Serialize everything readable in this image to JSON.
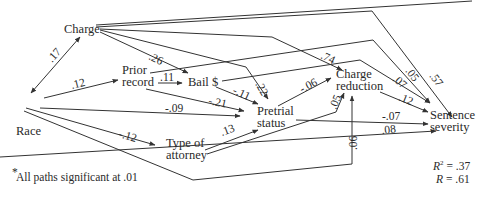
{
  "diagram": {
    "type": "path-analysis",
    "nodes": {
      "charge": {
        "label": "Charge"
      },
      "race": {
        "label": "Race"
      },
      "prior_record": {
        "line1": "Prior",
        "line2": "record"
      },
      "bail": {
        "label": "Bail $"
      },
      "pretrial_status": {
        "line1": "Pretrial",
        "line2": "status"
      },
      "type_of_attorney": {
        "line1": "Type of",
        "line2": "attorney"
      },
      "charge_reduction": {
        "line1": "Charge",
        "line2": "reduction"
      },
      "sentence_severity": {
        "line1": "Sentence",
        "line2": "severity"
      }
    },
    "edges": [
      {
        "from": "Race",
        "to": "Charge",
        "coef": ".17",
        "bidirectional": true
      },
      {
        "from": "Race",
        "to": "Prior record",
        "coef": ".12"
      },
      {
        "from": "Race",
        "to": "Pretrial status",
        "coef": "-.09"
      },
      {
        "from": "Race",
        "to": "Type of attorney",
        "coef": "-.12"
      },
      {
        "from": "Race",
        "to": "Charge reduction",
        "coef": ".06"
      },
      {
        "from": "Charge",
        "to": "Bail $",
        "coef": ".26"
      },
      {
        "from": "Charge",
        "to": "Pretrial status",
        "coef": ".22"
      },
      {
        "from": "Charge",
        "to": "Charge reduction",
        "coef": ".74"
      },
      {
        "from": "Charge",
        "to": "Sentence severity",
        "coef": ".05"
      },
      {
        "from": "Charge",
        "to": "Sentence severity",
        "coef": ".57"
      },
      {
        "from": "Prior record",
        "to": "Bail $",
        "coef": ".11"
      },
      {
        "from": "Prior record",
        "to": "Pretrial status",
        "coef": "-.21"
      },
      {
        "from": "Prior record",
        "to": "Sentence severity",
        "coef": ".07"
      },
      {
        "from": "Bail $",
        "to": "Pretrial status",
        "coef": "-.11"
      },
      {
        "from": "Bail $",
        "to": "Sentence severity",
        "coef": ""
      },
      {
        "from": "Pretrial status",
        "to": "Charge reduction",
        "coef": "-.06"
      },
      {
        "from": "Pretrial status",
        "to": "Sentence severity",
        "coef": "-.07"
      },
      {
        "from": "Type of attorney",
        "to": "Pretrial status",
        "coef": ".13"
      },
      {
        "from": "Type of attorney",
        "to": "Charge reduction",
        "coef": ".05"
      },
      {
        "from": "Type of attorney",
        "to": "Sentence severity",
        "coef": ".08"
      },
      {
        "from": "Charge reduction",
        "to": "Sentence severity",
        "coef": ".12"
      }
    ],
    "labels": {
      "race_charge": ".17",
      "race_prior": ".12",
      "race_pretrial": "-.09",
      "race_attorney": "-.12",
      "race_reduction": ".06",
      "charge_bail": ".26",
      "charge_pretrial": ".22",
      "charge_reduction": ".74",
      "charge_sentence_a": ".05",
      "charge_sentence_b": ".57",
      "prior_bail": ".11",
      "prior_pretrial": "-.21",
      "prior_sentence": ".07",
      "bail_pretrial": "-.11",
      "pretrial_reduction": "-.06",
      "pretrial_sentence": "-.07",
      "attorney_pretrial": ".13",
      "attorney_reduction": ".05",
      "attorney_sentence": ".08",
      "reduction_sentence": ".12"
    },
    "footnote": {
      "marker": "*",
      "text": "All paths significant at .01"
    },
    "stats": {
      "r2_label": "R",
      "r2_sup": "2",
      "r2_value": " = .37",
      "r_label": "R",
      "r_value": " = .61"
    }
  }
}
